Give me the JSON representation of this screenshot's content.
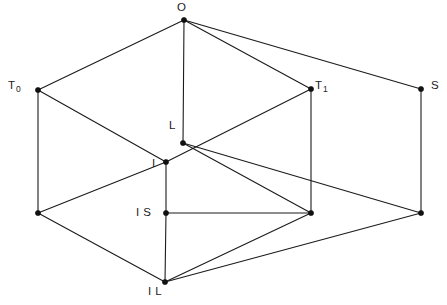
{
  "figure": {
    "type": "lattice-diagram",
    "width": 447,
    "height": 305,
    "background_color": "#ffffff",
    "line_color": "#1b1b1b",
    "vertex_color": "#111111"
  },
  "nodes": [
    {
      "id": "O",
      "label": "O",
      "sub": "",
      "x": 184,
      "y": 20,
      "labelled": true
    },
    {
      "id": "T0",
      "label": "T",
      "sub": "0",
      "x": 38,
      "y": 90,
      "labelled": true
    },
    {
      "id": "T1",
      "label": "T",
      "sub": "1",
      "x": 311,
      "y": 89,
      "labelled": true
    },
    {
      "id": "S",
      "label": "S",
      "sub": "",
      "x": 421,
      "y": 89,
      "labelled": true
    },
    {
      "id": "L",
      "label": "L",
      "sub": "",
      "x": 183,
      "y": 143,
      "labelled": true
    },
    {
      "id": "I",
      "label": "I",
      "sub": "",
      "x": 166,
      "y": 162,
      "labelled": true
    },
    {
      "id": "IS",
      "label": "I S",
      "sub": "",
      "x": 166,
      "y": 213,
      "labelled": true
    },
    {
      "id": "IL",
      "label": "I L",
      "sub": "",
      "x": 165,
      "y": 282,
      "labelled": true
    },
    {
      "id": "V1",
      "label": "",
      "sub": "",
      "x": 38,
      "y": 213,
      "labelled": false
    },
    {
      "id": "V2",
      "label": "",
      "sub": "",
      "x": 311,
      "y": 213,
      "labelled": false
    },
    {
      "id": "V3",
      "label": "",
      "sub": "",
      "x": 421,
      "y": 213,
      "labelled": false
    }
  ],
  "edges": [
    {
      "from": "O",
      "to": "T0"
    },
    {
      "from": "O",
      "to": "T1"
    },
    {
      "from": "O",
      "to": "S"
    },
    {
      "from": "O",
      "to": "L"
    },
    {
      "from": "T0",
      "to": "I"
    },
    {
      "from": "T1",
      "to": "I"
    },
    {
      "from": "T0",
      "to": "V1"
    },
    {
      "from": "T1",
      "to": "V2"
    },
    {
      "from": "S",
      "to": "V3"
    },
    {
      "from": "L",
      "to": "V2"
    },
    {
      "from": "L",
      "to": "V3"
    },
    {
      "from": "I",
      "to": "IS"
    },
    {
      "from": "I",
      "to": "V1"
    },
    {
      "from": "IS",
      "to": "V2"
    },
    {
      "from": "IS",
      "to": "IL"
    },
    {
      "from": "V1",
      "to": "IL"
    },
    {
      "from": "V2",
      "to": "IL"
    },
    {
      "from": "V3",
      "to": "IL"
    }
  ]
}
